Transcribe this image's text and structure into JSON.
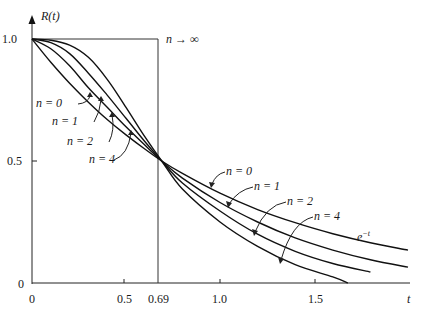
{
  "chart_data": {
    "type": "line",
    "title": "",
    "xlabel": "t",
    "ylabel": "R(t)",
    "xlim": [
      0,
      2.0
    ],
    "ylim": [
      0,
      1.0
    ],
    "x_ticks": [
      {
        "value": 0,
        "label": "0"
      },
      {
        "value": 0.5,
        "label": "0.5"
      },
      {
        "value": 0.69,
        "label": "0.69"
      },
      {
        "value": 1.0,
        "label": "1.0"
      },
      {
        "value": 1.5,
        "label": "1.5"
      }
    ],
    "y_ticks": [
      {
        "value": 0,
        "label": "0"
      },
      {
        "value": 0.5,
        "label": "0.5"
      },
      {
        "value": 1.0,
        "label": "1.0"
      }
    ],
    "grid": false,
    "annotations": [
      "n → ∞",
      "e^-t",
      "n = 0",
      "n = 1",
      "n = 2",
      "n = 4"
    ],
    "limit_curve": {
      "name": "n → ∞",
      "x": [
        0,
        0.69,
        0.69,
        2.0
      ],
      "y": [
        1.0,
        1.0,
        0,
        0
      ]
    },
    "series": [
      {
        "name": "n = 0",
        "annotation": "e^-t",
        "x": [
          0,
          0.1,
          0.2,
          0.3,
          0.4,
          0.5,
          0.6,
          0.69,
          0.8,
          1.0,
          1.2,
          1.4,
          1.6,
          1.8,
          2.0
        ],
        "y": [
          1.0,
          0.905,
          0.819,
          0.741,
          0.67,
          0.607,
          0.549,
          0.5,
          0.449,
          0.368,
          0.301,
          0.247,
          0.202,
          0.165,
          0.135
        ]
      },
      {
        "name": "n = 1",
        "x": [
          0,
          0.1,
          0.2,
          0.3,
          0.4,
          0.5,
          0.6,
          0.69,
          0.8,
          1.0,
          1.2,
          1.4,
          1.6,
          1.8,
          2.0
        ],
        "y": [
          1.0,
          0.96,
          0.89,
          0.8,
          0.72,
          0.64,
          0.565,
          0.5,
          0.43,
          0.33,
          0.25,
          0.185,
          0.135,
          0.095,
          0.065
        ]
      },
      {
        "name": "n = 2",
        "x": [
          0,
          0.1,
          0.2,
          0.3,
          0.4,
          0.5,
          0.6,
          0.69,
          0.8,
          1.0,
          1.2,
          1.4,
          1.6,
          1.8
        ],
        "y": [
          1.0,
          0.985,
          0.94,
          0.86,
          0.77,
          0.675,
          0.58,
          0.5,
          0.41,
          0.295,
          0.2,
          0.13,
          0.08,
          0.045
        ]
      },
      {
        "name": "n = 4",
        "x": [
          0,
          0.1,
          0.2,
          0.3,
          0.4,
          0.5,
          0.6,
          0.69,
          0.8,
          1.0,
          1.2,
          1.4,
          1.6,
          1.68
        ],
        "y": [
          1.0,
          0.995,
          0.975,
          0.925,
          0.835,
          0.72,
          0.6,
          0.5,
          0.385,
          0.25,
          0.15,
          0.075,
          0.025,
          0.0
        ]
      }
    ]
  },
  "labels": {
    "y_axis": "R(t)",
    "x_axis": "t",
    "n_inf": "n → ∞",
    "exp": "e",
    "exp_sup": "−t",
    "left_labels": [
      "n = 0",
      "n = 1",
      "n = 2",
      "n = 4"
    ],
    "right_labels": [
      "n = 0",
      "n = 1",
      "n = 2",
      "n = 4"
    ],
    "x_tick_labels": [
      "0",
      "0.5",
      "0.69",
      "1.0",
      "1.5"
    ],
    "y_tick_labels": [
      "0",
      "0.5",
      "1.0"
    ]
  }
}
